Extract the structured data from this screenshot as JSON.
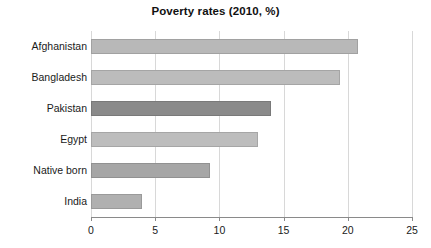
{
  "chart_data": {
    "type": "bar",
    "orientation": "horizontal",
    "title": "Poverty rates (2010, %)",
    "xlabel": "",
    "ylabel": "",
    "categories": [
      "Afghanistan",
      "Bangladesh",
      "Pakistan",
      "Egypt",
      "Native born",
      "India"
    ],
    "values": [
      20.8,
      19.4,
      14.0,
      13.0,
      9.3,
      4.0
    ],
    "bar_colors": [
      "#b8b8b8",
      "#bcbcbc",
      "#8a8a8a",
      "#bdbdbd",
      "#a6a6a6",
      "#b0b0b0"
    ],
    "xlim": [
      0,
      25
    ],
    "xticks": [
      0,
      5,
      10,
      15,
      20,
      25
    ],
    "xtick_labels": [
      "0",
      "5",
      "10",
      "15",
      "20",
      "25"
    ],
    "grid": "vertical",
    "legend": "none",
    "background": "#ffffff",
    "gridline_color": "#d8d8d8",
    "axis_color": "#8a8a8a"
  }
}
